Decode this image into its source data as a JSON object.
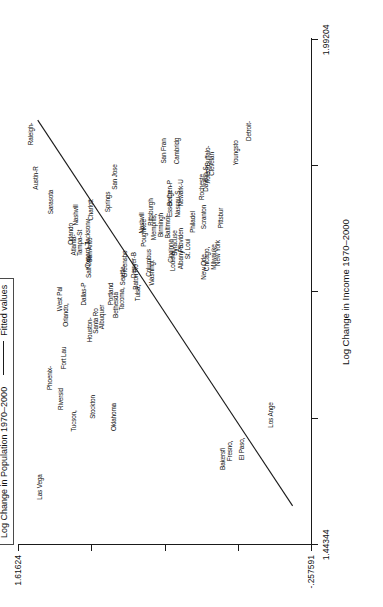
{
  "legend": {
    "series_label": "Log Change in Population 1970–2000",
    "fit_label": "Fitted values",
    "rule_icon": "horizontal-line-icon"
  },
  "axes": {
    "x_title": "Log Change in Income 1970–2000",
    "x_ticks": [
      "1.44344",
      "",
      "",
      "",
      "1.99204"
    ],
    "x_min_label": "1.44344",
    "x_max_label": "1.99204",
    "y_ticks": [
      "-.257591",
      "",
      "",
      "",
      "1.61624"
    ],
    "y_min_label": "-.257591",
    "y_max_label": "1.61624"
  },
  "chart_data": {
    "type": "scatter",
    "title": "",
    "xlabel": "Log Change in Income 1970–2000",
    "ylabel": "Log Change in Population 1970–2000",
    "xlim": [
      1.44344,
      1.99204
    ],
    "ylim": [
      -0.257591,
      1.61624
    ],
    "grid": false,
    "legend_position": "top-left",
    "marker_style": "text-label",
    "fit_line": {
      "name": "Fitted values",
      "x": [
        1.486,
        1.905
      ],
      "y": [
        -0.14,
        1.49
      ]
    },
    "points": [
      {
        "label": "Las Vega",
        "x": 1.547,
        "y": 1.52
      },
      {
        "label": "Austin-R",
        "x": 1.878,
        "y": 1.2
      },
      {
        "label": "Raleigh-",
        "x": 1.926,
        "y": 1.3
      },
      {
        "label": "Sarasota",
        "x": 1.852,
        "y": 1.12
      },
      {
        "label": "Orlando,",
        "x": 1.7,
        "y": 0.99
      },
      {
        "label": "West Pal",
        "x": 1.706,
        "y": 1.02
      },
      {
        "label": "Phoenix-",
        "x": 1.631,
        "y": 1.09
      },
      {
        "label": "Fort Lau",
        "x": 1.651,
        "y": 1.01
      },
      {
        "label": "Riversid",
        "x": 1.608,
        "y": 1.055
      },
      {
        "label": "Tucson,",
        "x": 1.584,
        "y": 0.985
      },
      {
        "label": "San Jose",
        "x": 1.833,
        "y": 0.7
      },
      {
        "label": "Atlanta-",
        "x": 1.782,
        "y": 0.93
      },
      {
        "label": "Orlando",
        "x": 1.788,
        "y": 0.945
      },
      {
        "label": "Tampa-St",
        "x": 1.775,
        "y": 0.94
      },
      {
        "label": "Nashvill",
        "x": 1.801,
        "y": 0.8
      },
      {
        "label": "Charlott",
        "x": 1.797,
        "y": 0.845
      },
      {
        "label": "Salt Lak",
        "x": 1.757,
        "y": 0.9
      },
      {
        "label": "Oxnard-T",
        "x": 1.761,
        "y": 0.905
      },
      {
        "label": "Dallas-P",
        "x": 1.731,
        "y": 0.935
      },
      {
        "label": "San Anto",
        "x": 1.766,
        "y": 0.88
      },
      {
        "label": "Jacksonv",
        "x": 1.772,
        "y": 0.875
      },
      {
        "label": "Houston-",
        "x": 1.69,
        "y": 0.93
      },
      {
        "label": "Santa Ro",
        "x": 1.694,
        "y": 0.925
      },
      {
        "label": "Albuquer",
        "x": 1.699,
        "y": 0.905
      },
      {
        "label": "Portland",
        "x": 1.718,
        "y": 0.82
      },
      {
        "label": "Bethesda",
        "x": 1.711,
        "y": 0.805
      },
      {
        "label": "Tacoma,",
        "x": 1.714,
        "y": 0.795
      },
      {
        "label": "Seattle-",
        "x": 1.753,
        "y": 0.76
      },
      {
        "label": "Greensbo",
        "x": 1.757,
        "y": 0.755
      },
      {
        "label": "Baton Ro",
        "x": 1.74,
        "y": 0.735
      },
      {
        "label": "Denver-B",
        "x": 1.744,
        "y": 0.745
      },
      {
        "label": "Tulsa,",
        "x": 1.735,
        "y": 0.72
      },
      {
        "label": "Oklahoma",
        "x": 1.588,
        "y": 0.69
      },
      {
        "label": "Stockton",
        "x": 1.6,
        "y": 0.745
      },
      {
        "label": "Columbus",
        "x": 1.752,
        "y": 0.69
      },
      {
        "label": "Washingt",
        "x": 1.747,
        "y": 0.675
      },
      {
        "label": "Poughkee",
        "x": 1.779,
        "y": 0.68
      },
      {
        "label": "Nashvill",
        "x": 1.786,
        "y": 0.685
      },
      {
        "label": "Memphis,",
        "x": 1.79,
        "y": 0.64
      },
      {
        "label": "Birmingh",
        "x": 1.794,
        "y": 0.63
      },
      {
        "label": "Pittsburgh",
        "x": 1.8,
        "y": 0.62
      },
      {
        "label": "Baltimor",
        "x": 1.784,
        "y": 0.61
      },
      {
        "label": "Cincinna",
        "x": 1.765,
        "y": 0.59
      },
      {
        "label": "Louisvil",
        "x": 1.761,
        "y": 0.585
      },
      {
        "label": "Syracuse",
        "x": 1.769,
        "y": 0.58
      },
      {
        "label": "Albany-S",
        "x": 1.758,
        "y": 0.565
      },
      {
        "label": "Providen",
        "x": 1.772,
        "y": 0.56
      },
      {
        "label": "St. Loui",
        "x": 1.764,
        "y": 0.54
      },
      {
        "label": "Essex Co",
        "x": 1.806,
        "y": 0.57
      },
      {
        "label": "Bergen-P",
        "x": 1.812,
        "y": 0.565
      },
      {
        "label": "Nassau-S",
        "x": 1.802,
        "y": 0.545
      },
      {
        "label": "Newark-U",
        "x": 1.816,
        "y": 0.54
      },
      {
        "label": "San Fran",
        "x": 1.862,
        "y": 0.56
      },
      {
        "label": "Cambridg",
        "x": 1.868,
        "y": 0.54
      },
      {
        "label": "Philadel",
        "x": 1.79,
        "y": 0.49
      },
      {
        "label": "Scranton",
        "x": 1.796,
        "y": 0.47
      },
      {
        "label": "New Orle",
        "x": 1.755,
        "y": 0.455
      },
      {
        "label": "Chicago,",
        "x": 1.76,
        "y": 0.45
      },
      {
        "label": "Milwauke",
        "x": 1.766,
        "y": 0.43
      },
      {
        "label": "New York",
        "x": 1.77,
        "y": 0.425
      },
      {
        "label": "Pittsbur",
        "x": 1.793,
        "y": 0.405
      },
      {
        "label": "Rocheste",
        "x": 1.822,
        "y": 0.37
      },
      {
        "label": "Dayton-S",
        "x": 1.83,
        "y": 0.36
      },
      {
        "label": "Toledo,",
        "x": 1.836,
        "y": 0.355
      },
      {
        "label": "Clevelan",
        "x": 1.845,
        "y": 0.34
      },
      {
        "label": "Buffalo-",
        "x": 1.851,
        "y": 0.325
      },
      {
        "label": "Youngsto",
        "x": 1.858,
        "y": 0.215
      },
      {
        "label": "Detroit-",
        "x": 1.878,
        "y": 0.14
      },
      {
        "label": "Bakersfi",
        "x": 1.592,
        "y": 0.3
      },
      {
        "label": "Fresno,",
        "x": 1.598,
        "y": 0.295
      },
      {
        "label": "El Paso,",
        "x": 1.604,
        "y": 0.255
      },
      {
        "label": "Los Ange",
        "x": 1.65,
        "y": 0.135
      }
    ]
  },
  "labels": [
    {
      "name": "las-vegas",
      "text": "Las Vega",
      "left": 58,
      "top": 22
    },
    {
      "name": "bakersfield",
      "text": "Bakersfi",
      "left": 86,
      "top": 205
    },
    {
      "name": "fresno",
      "text": "Fresno,",
      "left": 94,
      "top": 212
    },
    {
      "name": "el-paso",
      "text": "El Paso,",
      "left": 96,
      "top": 224
    },
    {
      "name": "los-angeles",
      "text": "Los Ange",
      "left": 130,
      "top": 253
    },
    {
      "name": "tucson",
      "text": "Tucson,",
      "left": 124,
      "top": 56
    },
    {
      "name": "riverside",
      "text": "Riversid",
      "left": 146,
      "top": 43
    },
    {
      "name": "phoenix",
      "text": "Phoenix-",
      "left": 167,
      "top": 32
    },
    {
      "name": "fort-lauderdale",
      "text": "Fort Lau",
      "left": 187,
      "top": 46
    },
    {
      "name": "orlando-2",
      "text": "Orlando,",
      "left": 230,
      "top": 48
    },
    {
      "name": "west-palm",
      "text": "West Pal",
      "left": 246,
      "top": 42
    },
    {
      "name": "sarasota",
      "text": "Sarasota",
      "left": 343,
      "top": 33
    },
    {
      "name": "austin",
      "text": "Austin-R",
      "left": 367,
      "top": 18
    },
    {
      "name": "raleigh",
      "text": "Raleigh-",
      "left": 411,
      "top": 13
    },
    {
      "name": "stockton",
      "text": "Stockton",
      "left": 138,
      "top": 75
    },
    {
      "name": "oklahoma-city",
      "text": "Oklahoma",
      "text2": "",
      "left": 128,
      "top": 96
    },
    {
      "name": "houston",
      "text": "Houston-",
      "left": 215,
      "top": 72
    },
    {
      "name": "santa-rosa",
      "text": "Santa Ro",
      "left": 224,
      "top": 78
    },
    {
      "name": "albuquerque",
      "text": "Albuquer",
      "left": 228,
      "top": 84
    },
    {
      "name": "dallas",
      "text": "Dallas-P",
      "left": 251,
      "top": 66
    },
    {
      "name": "bethesda",
      "text": "Bethesda",
      "left": 240,
      "top": 98
    },
    {
      "name": "tacoma",
      "text": "Tacoma,",
      "left": 246,
      "top": 104
    },
    {
      "name": "portland",
      "text": "Portland",
      "left": 251,
      "top": 93
    },
    {
      "name": "salt-lake",
      "text": "Salt Lak",
      "left": 278,
      "top": 71
    },
    {
      "name": "oxnard",
      "text": "Oxnard-T",
      "left": 290,
      "top": 70
    },
    {
      "name": "atlanta",
      "text": "Atlanta-",
      "left": 300,
      "top": 56
    },
    {
      "name": "orlando",
      "text": "Orlando",
      "left": 311,
      "top": 53
    },
    {
      "name": "tampa",
      "text": "Tampa-St",
      "left": 302,
      "top": 62
    },
    {
      "name": "san-antonio",
      "text": "San Anto",
      "left": 295,
      "top": 72
    },
    {
      "name": "jacksonville",
      "text": "Jacksonv",
      "left": 313,
      "top": 70
    },
    {
      "name": "nashville",
      "text": "Nashvill",
      "left": 330,
      "top": 58
    },
    {
      "name": "charlotte",
      "text": "Charlott",
      "left": 335,
      "top": 73
    },
    {
      "name": "seattle",
      "text": "Seattle-",
      "left": 270,
      "top": 105
    },
    {
      "name": "greensboro",
      "text": "Greensbo",
      "left": 281,
      "top": 107
    },
    {
      "name": "baton-rouge",
      "text": "Baton Ro",
      "left": 268,
      "top": 118
    },
    {
      "name": "denver",
      "text": "Denver-B",
      "left": 280,
      "top": 116
    },
    {
      "name": "tulsa",
      "text": "Tulsa,",
      "left": 252,
      "top": 120
    },
    {
      "name": "columbus",
      "text": "Columbus",
      "left": 282,
      "top": 131
    },
    {
      "name": "washington",
      "text": "Washingt",
      "left": 272,
      "top": 134
    },
    {
      "name": "poughkeepsie",
      "text": "Poughkee",
      "left": 312,
      "top": 126
    },
    {
      "name": "nashville-2",
      "text": "Nashvill",
      "left": 322,
      "top": 124
    },
    {
      "name": "memphis",
      "text": "Memphis,",
      "left": 318,
      "top": 136
    },
    {
      "name": "birmingham",
      "text": "Birmingh",
      "left": 320,
      "top": 143
    },
    {
      "name": "pittsburgh-2",
      "text": "Pittsburgh",
      "left": 333,
      "top": 133
    },
    {
      "name": "baltimore",
      "text": "Baltimor",
      "left": 318,
      "top": 150
    },
    {
      "name": "cincinnati",
      "text": "Cincinna",
      "left": 294,
      "top": 153
    },
    {
      "name": "louisville",
      "text": "Louisvil",
      "left": 284,
      "top": 155
    },
    {
      "name": "syracuse",
      "text": "Syracuse",
      "left": 302,
      "top": 157
    },
    {
      "name": "albany",
      "text": "Albany-S",
      "left": 288,
      "top": 163
    },
    {
      "name": "providence",
      "text": "Providen",
      "left": 305,
      "top": 163
    },
    {
      "name": "st-louis",
      "text": "St. Loui",
      "left": 296,
      "top": 170
    },
    {
      "name": "essex",
      "text": "Essex Co",
      "left": 341,
      "top": 152
    },
    {
      "name": "bergen",
      "text": "Bergen-P",
      "left": 352,
      "top": 152
    },
    {
      "name": "nassau",
      "text": "Nassau-S",
      "left": 341,
      "top": 160
    },
    {
      "name": "newark",
      "text": "Newark-U",
      "left": 352,
      "top": 163
    },
    {
      "name": "san-francisco",
      "text": "San Fran",
      "left": 394,
      "top": 146
    },
    {
      "name": "cambridge",
      "text": "Cambridg",
      "left": 394,
      "top": 159
    },
    {
      "name": "philadelphia",
      "text": "Philadel",
      "left": 323,
      "top": 175
    },
    {
      "name": "scranton",
      "text": "Scranton",
      "left": 328,
      "top": 186
    },
    {
      "name": "new-orleans",
      "text": "New Orle",
      "left": 278,
      "top": 186
    },
    {
      "name": "chicago",
      "text": "Chicago,",
      "left": 286,
      "top": 189
    },
    {
      "name": "milwaukee",
      "text": "Milwauke",
      "left": 288,
      "top": 196
    },
    {
      "name": "new-york",
      "text": "New York",
      "left": 292,
      "top": 200
    },
    {
      "name": "pittsburgh",
      "text": "Pittsbur",
      "left": 327,
      "top": 203
    },
    {
      "name": "rochester",
      "text": "Rocheste",
      "left": 358,
      "top": 184
    },
    {
      "name": "dayton",
      "text": "Dayton-S",
      "left": 366,
      "top": 188
    },
    {
      "name": "toledo",
      "text": "Toledo,",
      "left": 372,
      "top": 190
    },
    {
      "name": "cleveland",
      "text": "Clevelan",
      "left": 381,
      "top": 194
    },
    {
      "name": "buffalo",
      "text": "Buffalo-",
      "left": 389,
      "top": 190
    },
    {
      "name": "youngstown",
      "text": "Youngsto",
      "left": 392,
      "top": 218
    },
    {
      "name": "detroit",
      "text": "Detroit-",
      "left": 414,
      "top": 231
    },
    {
      "name": "san-jose",
      "text": "San Jose",
      "left": 368,
      "top": 97
    },
    {
      "name": "springs",
      "text": "Springs",
      "left": 343,
      "top": 90
    }
  ]
}
